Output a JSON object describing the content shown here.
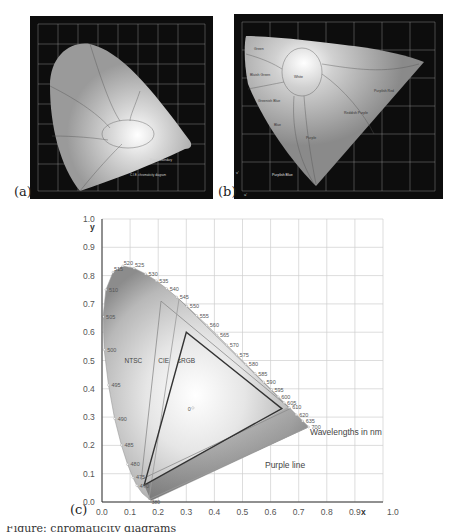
{
  "figure": {
    "panels": [
      {
        "id": "a",
        "label": "(a)",
        "description": "CIE 1931 xy chromaticity diagram with named color regions on dark background"
      },
      {
        "id": "b",
        "label": "(b)",
        "description": "CIE 1976 u'v' chromaticity diagram with named color regions on dark background",
        "region_labels": [
          "Green",
          "Bluish Green",
          "Greenish Blue",
          "Blue",
          "Purplish Blue",
          "Purple",
          "Reddish Purple",
          "Purplish Red",
          "Yellowish Green",
          "Yellow",
          "Orange",
          "Red",
          "White"
        ],
        "axis_labels": {
          "x": "u'",
          "y": "v'"
        }
      },
      {
        "id": "c",
        "label": "(c)"
      }
    ],
    "caption_fragment": "Figure: chromaticity diagrams"
  },
  "chart_data": {
    "type": "scatter",
    "title": "",
    "xlabel": "x",
    "ylabel": "y",
    "xlim": [
      0.0,
      1.0
    ],
    "ylim": [
      0.0,
      1.0
    ],
    "grid": true,
    "x_ticks": [
      "0.0",
      "0.1",
      "0.2",
      "0.3",
      "0.4",
      "0.5",
      "0.6",
      "0.7",
      "0.8",
      "0.9",
      "1.0"
    ],
    "y_ticks": [
      "0.0",
      "0.1",
      "0.2",
      "0.3",
      "0.4",
      "0.5",
      "0.6",
      "0.7",
      "0.8",
      "0.9",
      "1.0"
    ],
    "spectral_locus": {
      "name": "Wavelengths in nm",
      "points": [
        {
          "nm": "380",
          "x": 0.174,
          "y": 0.005
        },
        {
          "nm": "460",
          "x": 0.144,
          "y": 0.03
        },
        {
          "nm": "470",
          "x": 0.124,
          "y": 0.058
        },
        {
          "nm": "475",
          "x": 0.11,
          "y": 0.087
        },
        {
          "nm": "480",
          "x": 0.091,
          "y": 0.133
        },
        {
          "nm": "485",
          "x": 0.069,
          "y": 0.201
        },
        {
          "nm": "490",
          "x": 0.045,
          "y": 0.295
        },
        {
          "nm": "495",
          "x": 0.023,
          "y": 0.413
        },
        {
          "nm": "500",
          "x": 0.008,
          "y": 0.538
        },
        {
          "nm": "505",
          "x": 0.004,
          "y": 0.655
        },
        {
          "nm": "510",
          "x": 0.014,
          "y": 0.75
        },
        {
          "nm": "515",
          "x": 0.039,
          "y": 0.812
        },
        {
          "nm": "520",
          "x": 0.074,
          "y": 0.834
        },
        {
          "nm": "525",
          "x": 0.114,
          "y": 0.826
        },
        {
          "nm": "530",
          "x": 0.155,
          "y": 0.806
        },
        {
          "nm": "535",
          "x": 0.193,
          "y": 0.782
        },
        {
          "nm": "540",
          "x": 0.23,
          "y": 0.754
        },
        {
          "nm": "545",
          "x": 0.266,
          "y": 0.724
        },
        {
          "nm": "550",
          "x": 0.302,
          "y": 0.692
        },
        {
          "nm": "555",
          "x": 0.337,
          "y": 0.659
        },
        {
          "nm": "560",
          "x": 0.373,
          "y": 0.625
        },
        {
          "nm": "565",
          "x": 0.409,
          "y": 0.59
        },
        {
          "nm": "570",
          "x": 0.444,
          "y": 0.555
        },
        {
          "nm": "575",
          "x": 0.479,
          "y": 0.52
        },
        {
          "nm": "580",
          "x": 0.512,
          "y": 0.487
        },
        {
          "nm": "585",
          "x": 0.545,
          "y": 0.454
        },
        {
          "nm": "590",
          "x": 0.575,
          "y": 0.424
        },
        {
          "nm": "595",
          "x": 0.603,
          "y": 0.397
        },
        {
          "nm": "600",
          "x": 0.627,
          "y": 0.372
        },
        {
          "nm": "605",
          "x": 0.648,
          "y": 0.351
        },
        {
          "nm": "610",
          "x": 0.666,
          "y": 0.334
        },
        {
          "nm": "620",
          "x": 0.691,
          "y": 0.308
        },
        {
          "nm": "635",
          "x": 0.714,
          "y": 0.286
        },
        {
          "nm": "700",
          "x": 0.735,
          "y": 0.265
        }
      ]
    },
    "purple_line": {
      "label": "Purple line",
      "from": [
        0.174,
        0.005
      ],
      "to": [
        0.735,
        0.265
      ]
    },
    "series": [
      {
        "name": "NTSC",
        "type": "triangle",
        "vertices": [
          [
            0.67,
            0.33
          ],
          [
            0.21,
            0.71
          ],
          [
            0.14,
            0.08
          ]
        ]
      },
      {
        "name": "CIE",
        "type": "triangle",
        "vertices": [
          [
            0.735,
            0.265
          ],
          [
            0.274,
            0.717
          ],
          [
            0.167,
            0.009
          ]
        ]
      },
      {
        "name": "sRGB",
        "type": "triangle",
        "vertices": [
          [
            0.64,
            0.33
          ],
          [
            0.3,
            0.6
          ],
          [
            0.15,
            0.06
          ]
        ]
      }
    ],
    "white_point": {
      "label": "0",
      "x": 0.3127,
      "y": 0.329
    },
    "annotations": [
      {
        "text": "NTSC",
        "x": 0.08,
        "y": 0.49
      },
      {
        "text": "CIE",
        "x": 0.2,
        "y": 0.49
      },
      {
        "text": "sRGB",
        "x": 0.27,
        "y": 0.49
      },
      {
        "text": "Wavelengths in nm",
        "x": 0.74,
        "y": 0.235
      },
      {
        "text": "Purple line",
        "x": 0.58,
        "y": 0.12
      }
    ],
    "legend": "none"
  }
}
